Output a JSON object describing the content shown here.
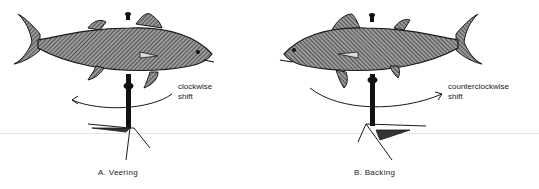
{
  "figure": {
    "panels": [
      {
        "id": "A",
        "caption": "A.  Veering",
        "shift_label_line1": "clockwise",
        "shift_label_line2": "shift",
        "fish_facing": "right",
        "arrow_direction": "left"
      },
      {
        "id": "B",
        "caption": "B.  Backing",
        "shift_label_line1": "counterclockwise",
        "shift_label_line2": "shift",
        "fish_facing": "left",
        "arrow_direction": "right"
      }
    ]
  },
  "colors": {
    "ink": "#1a1a1a",
    "fish_fill": "#8a8a8a",
    "background": "#ffffff",
    "divider": "#e4e4e4"
  }
}
